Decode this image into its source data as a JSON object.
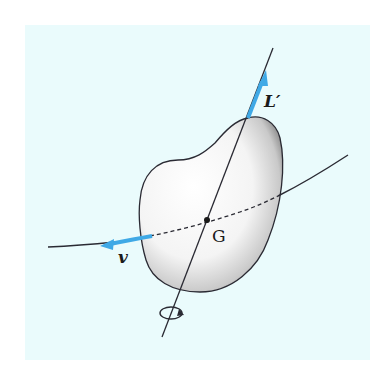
{
  "figure": {
    "background_color": "#eafbfc",
    "accent_color": "#3fa9e6",
    "line_color": "#2a2a33",
    "labels": {
      "angular_momentum": "L′",
      "velocity": "v",
      "center_of_mass": "G"
    },
    "elements": {
      "body": "rigid-body",
      "axis": "rotation-axis",
      "trajectory": "path-of-G",
      "rotation_indicator": "rotation-arrow"
    }
  }
}
